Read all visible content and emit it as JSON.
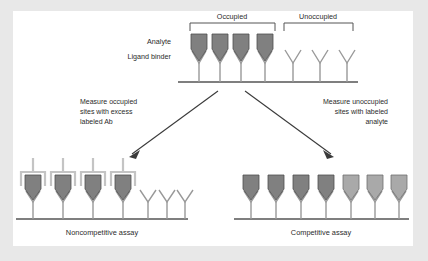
{
  "figure": {
    "background_color": "#e8e8e8",
    "panel_color": "#ffffff",
    "line_color": "#555555",
    "text_color": "#2b2b2b",
    "analyte_color": "#808080",
    "labeled_analyte_color": "#a9a9a9",
    "labeled_ab_color": "#c4c4c4"
  },
  "top_panel": {
    "bracket_occupied_label": "Occupied",
    "bracket_unoccupied_label": "Unoccupied",
    "analyte_label": "Analyte",
    "ligand_binder_label": "Ligand binder",
    "occupied_sites_count": 4,
    "unoccupied_sites_count": 3
  },
  "arrows": {
    "left_text_lines": [
      "Measure occupied",
      "sites with excess",
      "labeled Ab"
    ],
    "right_text_lines": [
      "Measure unoccupied",
      "sites with labeled",
      "analyte"
    ]
  },
  "bottom_left_panel": {
    "caption": "Noncompetitive assay",
    "occupied_labeled_count": 4,
    "unoccupied_count": 3
  },
  "bottom_right_panel": {
    "caption": "Competitive assay",
    "analyte_count": 4,
    "labeled_analyte_count": 3
  }
}
